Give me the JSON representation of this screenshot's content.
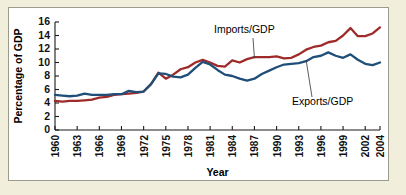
{
  "figure": {
    "background_color": "#f2eedc",
    "panel_color": "#ffffff",
    "border_color": "#9a9a8d"
  },
  "chart_data": {
    "type": "line",
    "title": "",
    "xlabel": "Year",
    "ylabel": "Percentage of GDP",
    "xlim": [
      1960,
      2004
    ],
    "ylim": [
      0,
      16
    ],
    "ytick_step": 2,
    "grid": false,
    "legend_position": "annotations-inline",
    "yticks": [
      0,
      2,
      4,
      6,
      8,
      10,
      12,
      14,
      16
    ],
    "xticks": [
      1960,
      1963,
      1966,
      1969,
      1972,
      1975,
      1978,
      1981,
      1984,
      1987,
      1990,
      1993,
      1996,
      1999,
      2002,
      2004
    ],
    "x": [
      1960,
      1961,
      1962,
      1963,
      1964,
      1965,
      1966,
      1967,
      1968,
      1969,
      1970,
      1971,
      1972,
      1973,
      1974,
      1975,
      1976,
      1977,
      1978,
      1979,
      1980,
      1981,
      1982,
      1983,
      1984,
      1985,
      1986,
      1987,
      1988,
      1989,
      1990,
      1991,
      1992,
      1993,
      1994,
      1995,
      1996,
      1997,
      1998,
      1999,
      2000,
      2001,
      2002,
      2003,
      2004
    ],
    "series": [
      {
        "name": "Imports/GDP",
        "color": "#9e2a2a",
        "annotation": "Imports/GDP",
        "values": [
          4.3,
          4.2,
          4.3,
          4.3,
          4.4,
          4.5,
          4.8,
          4.9,
          5.2,
          5.3,
          5.4,
          5.5,
          5.7,
          6.8,
          8.5,
          7.6,
          8.2,
          9.0,
          9.3,
          10.0,
          10.4,
          10.0,
          9.5,
          9.4,
          10.3,
          10.0,
          10.5,
          10.8,
          10.8,
          10.8,
          10.9,
          10.6,
          10.7,
          11.2,
          11.9,
          12.3,
          12.5,
          13.0,
          13.2,
          14.0,
          15.1,
          13.9,
          13.9,
          14.3,
          15.2
        ]
      },
      {
        "name": "Exports/GDP",
        "color": "#1f4e79",
        "annotation": "Exports/GDP",
        "values": [
          5.2,
          5.1,
          5.0,
          5.1,
          5.4,
          5.2,
          5.2,
          5.2,
          5.3,
          5.3,
          5.8,
          5.6,
          5.7,
          6.8,
          8.4,
          8.3,
          7.9,
          7.8,
          8.2,
          9.2,
          10.1,
          9.7,
          8.9,
          8.2,
          8.0,
          7.6,
          7.3,
          7.6,
          8.3,
          8.8,
          9.3,
          9.7,
          9.8,
          9.9,
          10.2,
          10.8,
          11.0,
          11.5,
          11.0,
          10.7,
          11.2,
          10.4,
          9.8,
          9.6,
          10.0
        ]
      }
    ]
  }
}
